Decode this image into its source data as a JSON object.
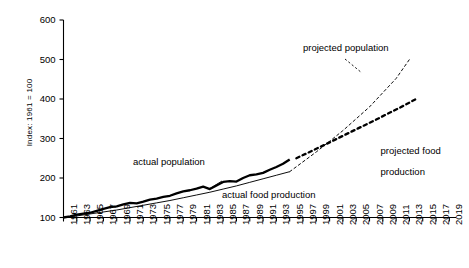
{
  "chart_data": {
    "type": "line",
    "title": "",
    "xlabel": "",
    "ylabel": "Index: 1961 = 100",
    "xlim": [
      1961,
      2020
    ],
    "ylim": [
      100,
      600
    ],
    "grid": false,
    "legend_position": "inline-annotations",
    "yticks": [
      100,
      200,
      300,
      400,
      500,
      600
    ],
    "xticks": [
      1961,
      1963,
      1965,
      1967,
      1969,
      1971,
      1973,
      1975,
      1977,
      1979,
      1981,
      1983,
      1985,
      1987,
      1989,
      1991,
      1993,
      1995,
      1997,
      1999,
      2001,
      2003,
      2005,
      2007,
      2009,
      2011,
      2013,
      2015,
      2017,
      2019
    ],
    "annotations": [
      {
        "id": "actual-population",
        "text": "actual population",
        "x": 1977,
        "y": 243
      },
      {
        "id": "actual-food-production",
        "text": "actual food production",
        "x": 1987,
        "y": 163
      },
      {
        "id": "projected-population",
        "text": "projected population",
        "x": 2001,
        "y": 480
      },
      {
        "id": "projected-food-production",
        "text": "projected food\nproduction",
        "x": 2009,
        "y": 320
      }
    ],
    "series": [
      {
        "name": "actual population",
        "style": "solid",
        "width": "thin",
        "x": [
          1961,
          1963,
          1965,
          1967,
          1969,
          1971,
          1973,
          1975,
          1977,
          1979,
          1981,
          1983,
          1985,
          1987,
          1989,
          1991,
          1993,
          1995
        ],
        "values": [
          100,
          104,
          109,
          114,
          119,
          125,
          131,
          137,
          143,
          150,
          157,
          164,
          172,
          180,
          189,
          198,
          207,
          216
        ]
      },
      {
        "name": "projected population",
        "style": "dashed",
        "width": "thin",
        "x": [
          1995,
          1999,
          2003,
          2007,
          2011,
          2013
        ],
        "values": [
          216,
          266,
          320,
          380,
          452,
          500
        ]
      },
      {
        "name": "actual food production",
        "style": "solid",
        "width": "thick",
        "x": [
          1961,
          1962,
          1963,
          1964,
          1965,
          1966,
          1967,
          1968,
          1969,
          1970,
          1971,
          1972,
          1973,
          1974,
          1975,
          1976,
          1977,
          1978,
          1979,
          1980,
          1981,
          1982,
          1983,
          1984,
          1985,
          1986,
          1987,
          1988,
          1989,
          1990,
          1991,
          1992,
          1993,
          1994,
          1995
        ],
        "values": [
          100,
          103,
          107,
          110,
          112,
          117,
          122,
          126,
          128,
          133,
          137,
          136,
          140,
          145,
          148,
          152,
          155,
          161,
          166,
          169,
          173,
          178,
          172,
          181,
          190,
          192,
          191,
          200,
          207,
          209,
          213,
          221,
          228,
          236,
          247
        ]
      },
      {
        "name": "projected food production",
        "style": "dashed",
        "width": "thick",
        "x": [
          1996,
          2000,
          2004,
          2008,
          2012,
          2014
        ],
        "values": [
          250,
          282,
          315,
          348,
          382,
          400
        ]
      }
    ]
  },
  "axis": {
    "y_title": "Index: 1961 = 100",
    "y_tick_labels": [
      "600",
      "500",
      "400",
      "300",
      "200",
      "100"
    ],
    "x_tick_labels": [
      "1961",
      "1963",
      "1965",
      "1967",
      "1969",
      "1971",
      "1973",
      "1975",
      "1977",
      "1979",
      "1981",
      "1983",
      "1985",
      "1987",
      "1989",
      "1991",
      "1993",
      "1995",
      "1997",
      "1999",
      "2001",
      "2003",
      "2005",
      "2007",
      "2009",
      "2011",
      "2013",
      "2015",
      "2017",
      "2019"
    ]
  },
  "labels": {
    "actual_population": "actual population",
    "actual_food_production": "actual food production",
    "projected_population": "projected population",
    "projected_food_production_line1": "projected food",
    "projected_food_production_line2": "production"
  },
  "colors": {
    "background": "#ffffff",
    "axis": "#000000",
    "line": "#000000",
    "text": "#000000"
  }
}
